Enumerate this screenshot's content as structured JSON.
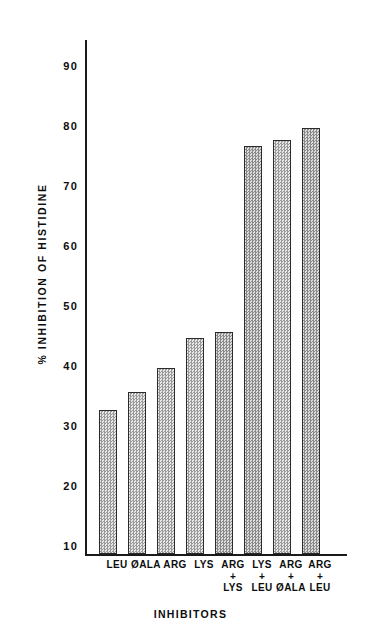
{
  "chart_data": {
    "type": "bar",
    "title": "",
    "xlabel": "INHIBITORS",
    "ylabel": "% INHIBITION OF HISTIDINE",
    "ylim": [
      10,
      96
    ],
    "yticks": [
      10,
      20,
      30,
      40,
      50,
      60,
      70,
      80,
      90
    ],
    "ytick_labels": [
      "10",
      "20",
      "30",
      "40",
      "50",
      "60",
      "70",
      "80",
      "90"
    ],
    "grid": false,
    "legend": null,
    "categories": [
      "LEU",
      "ØALA",
      "ARG",
      "LYS",
      "ARG + LYS",
      "LYS + LEU",
      "ARG + ØALA",
      "ARG + LEU"
    ],
    "values": [
      34,
      37,
      41,
      46,
      47,
      78,
      79,
      81
    ],
    "bars": [
      {
        "label_line1": "LEU",
        "label_line2": "",
        "label_line3": "",
        "value": 34,
        "shade": "light"
      },
      {
        "label_line1": "ØALA",
        "label_line2": "",
        "label_line3": "",
        "value": 37,
        "shade": "light"
      },
      {
        "label_line1": "ARG",
        "label_line2": "",
        "label_line3": "",
        "value": 41,
        "shade": "light"
      },
      {
        "label_line1": "LYS",
        "label_line2": "",
        "label_line3": "",
        "value": 46,
        "shade": "light"
      },
      {
        "label_line1": "ARG",
        "label_line2": "+",
        "label_line3": "LYS",
        "value": 47,
        "shade": "dark"
      },
      {
        "label_line1": "LYS",
        "label_line2": "+",
        "label_line3": "LEU",
        "value": 78,
        "shade": "dark"
      },
      {
        "label_line1": "ARG",
        "label_line2": "+",
        "label_line3": "ØALA",
        "value": 79,
        "shade": "light"
      },
      {
        "label_line1": "ARG",
        "label_line2": "+",
        "label_line3": "LEU",
        "value": 81,
        "shade": "dark"
      }
    ]
  },
  "colors": {
    "axis": "#1a1a1a",
    "bar_fill_light": "#cfcfcf",
    "bar_fill_dark": "#bdbdbd",
    "bar_edge": "#2b2b2b",
    "text": "#0d0d0d",
    "background": "#ffffff"
  }
}
